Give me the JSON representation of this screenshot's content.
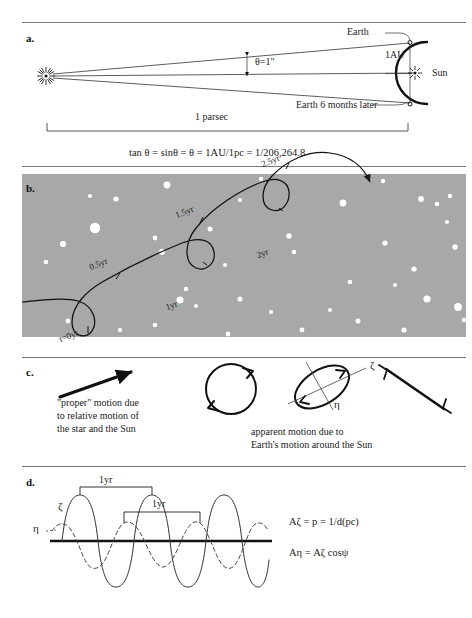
{
  "figure": {
    "title_internal": "Stellar parallax and proper motion figure",
    "background_color": "#ffffff",
    "starfield_color": "#a8a8a8",
    "ink_color": "#1a1a1a"
  },
  "panel_a": {
    "letter": "a.",
    "labels": {
      "earth": "Earth",
      "earth_six_months": "Earth 6 months later",
      "sun": "Sun",
      "one_au": "1AU",
      "theta": "θ=1\"",
      "parsec": "1 parsec"
    },
    "formula": "tan θ = sinθ = θ = 1AU/1pc = 1/206,264.8",
    "icons": {
      "star": "starburst-icon",
      "sun": "sun-starburst-icon"
    }
  },
  "panel_b": {
    "letter": "b.",
    "time_labels": [
      "t=0yr",
      "0.5yr",
      "1yr",
      "1.5yr",
      "2yr",
      "2.5yr"
    ],
    "description_internal": "looping apparent path of a star combining proper motion and annual parallax against background stars"
  },
  "panel_c": {
    "letter": "c.",
    "caption_left": "\"proper\" motion due\nto relative motion of\nthe star and the Sun",
    "caption_right": "apparent motion due to\nEarth's motion around the Sun",
    "axis_labels": {
      "zeta": "ζ",
      "eta": "η"
    }
  },
  "panel_d": {
    "letter": "d.",
    "bracket_labels": [
      "1yr",
      "1yr"
    ],
    "curve_labels": {
      "zeta": "ζ",
      "eta": "η"
    },
    "equations": [
      "Aζ = p = 1/d(pc)",
      "Aη = Aζ cosψ"
    ],
    "chart_hint": {
      "type": "line",
      "series": [
        {
          "name": "ζ",
          "style": "solid",
          "amplitude": 1.0,
          "period_years": 1
        },
        {
          "name": "η",
          "style": "dashed",
          "amplitude": 0.42,
          "period_years": 1
        }
      ]
    }
  }
}
